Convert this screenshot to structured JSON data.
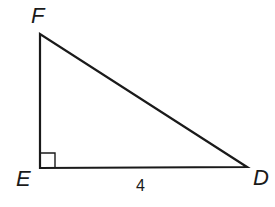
{
  "diagram": {
    "type": "right-triangle",
    "vertices": [
      {
        "name": "F",
        "label": "F",
        "x": 40,
        "y": 34
      },
      {
        "name": "E",
        "label": "E",
        "x": 40,
        "y": 168
      },
      {
        "name": "D",
        "label": "D",
        "x": 247,
        "y": 167
      }
    ],
    "right_angle_at": "E",
    "sides": [
      {
        "between": "E-D",
        "label": "4"
      }
    ],
    "stroke_color": "#1a1a1a"
  }
}
